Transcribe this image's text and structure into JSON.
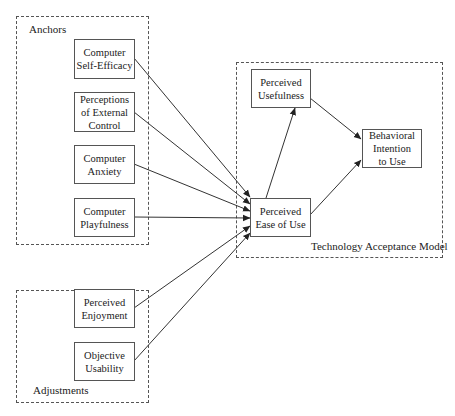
{
  "groups": {
    "anchors": {
      "label": "Anchors"
    },
    "adjustments": {
      "label": "Adjustments"
    },
    "tam": {
      "label": "Technology Acceptance Model"
    }
  },
  "nodes": {
    "computer_self_efficacy": "Computer\nSelf-Efficacy",
    "perceptions_external_control": "Perceptions\nof External\nControl",
    "computer_anxiety": "Computer\nAnxiety",
    "computer_playfulness": "Computer\nPlayfulness",
    "perceived_enjoyment": "Perceived\nEnjoyment",
    "objective_usability": "Objective\nUsability",
    "perceived_usefulness": "Perceived\nUsefulness",
    "perceived_ease_of_use": "Perceived\nEase of Use",
    "behavioral_intention": "Behavioral\nIntention\nto Use"
  },
  "edges": [
    {
      "from": "Computer Self-Efficacy",
      "to": "Perceived Ease of Use"
    },
    {
      "from": "Perceptions of External Control",
      "to": "Perceived Ease of Use"
    },
    {
      "from": "Computer Anxiety",
      "to": "Perceived Ease of Use"
    },
    {
      "from": "Computer Playfulness",
      "to": "Perceived Ease of Use"
    },
    {
      "from": "Perceived Enjoyment",
      "to": "Perceived Ease of Use"
    },
    {
      "from": "Objective Usability",
      "to": "Perceived Ease of Use"
    },
    {
      "from": "Perceived Ease of Use",
      "to": "Perceived Usefulness"
    },
    {
      "from": "Perceived Usefulness",
      "to": "Behavioral Intention to Use"
    },
    {
      "from": "Perceived Ease of Use",
      "to": "Behavioral Intention to Use"
    }
  ],
  "colors": {
    "line": "#333333",
    "border": "#555555"
  }
}
